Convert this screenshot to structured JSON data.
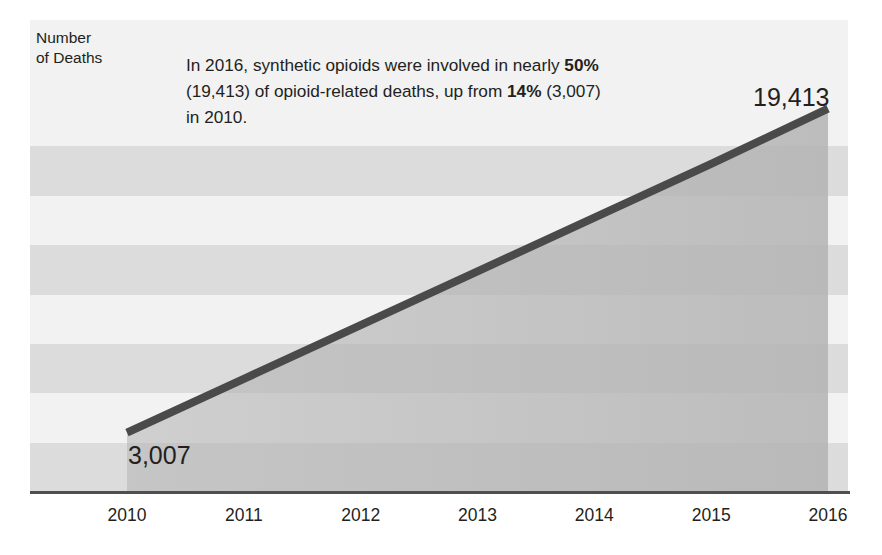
{
  "chart_data": {
    "type": "line",
    "title": "",
    "subtitle": "",
    "xlabel": "",
    "ylabel": "Number\nof Deaths",
    "ylabel_line1": "Number",
    "ylabel_line2": "of Deaths",
    "categories": [
      "2010",
      "2011",
      "2012",
      "2013",
      "2014",
      "2015",
      "2016"
    ],
    "x": [
      2010,
      2011,
      2012,
      2013,
      2014,
      2015,
      2016
    ],
    "series": [
      {
        "name": "Synthetic opioid-involved overdose deaths",
        "values": [
          3007,
          5728,
          8450,
          11171,
          13892,
          16614,
          19413
        ]
      }
    ],
    "point_labels": [
      {
        "name": "start-value",
        "text": "3,007",
        "x": 2010,
        "y": 3007
      },
      {
        "name": "end-value",
        "text": "19,413",
        "x": 2016,
        "y": 19413
      }
    ],
    "ylim": [
      0,
      20000
    ],
    "xlim": [
      2010,
      2016
    ],
    "ytick_values": [
      20000,
      15000,
      10000,
      5000,
      0
    ],
    "ytick_labels": [
      "20,000",
      "15,000",
      "10,000",
      "5,000",
      "0"
    ],
    "xtick_labels": [
      "2010",
      "2011",
      "2012",
      "2013",
      "2014",
      "2015",
      "2016"
    ],
    "grid": false,
    "banded_background": true,
    "band_step": 2500,
    "legend": "none",
    "legend_position": "none",
    "fill_under_line": true,
    "annotations": [
      {
        "name": "summary-callout",
        "segments": [
          {
            "text": "In 2016, synthetic opioids were involved in nearly ",
            "bold": false
          },
          {
            "text": "50%",
            "bold": true
          },
          {
            "text": " (19,413) of opioid-related deaths, up from ",
            "bold": false
          },
          {
            "text": "14%",
            "bold": true
          },
          {
            "text": " (3,007) in 2010.",
            "bold": false
          }
        ],
        "plain_text": "In 2016, synthetic opioids were involved in nearly 50% (19,413) of opioid-related deaths, up from 14% (3,007) in 2010."
      }
    ],
    "colors": {
      "line": "#4a4a4a",
      "fill": "#b3b3b3",
      "band_light": "#f2f2f2",
      "band_dark": "#dcdcdc",
      "axis": "#4f4f4f",
      "text": "#231f20",
      "background": "#ffffff"
    }
  }
}
